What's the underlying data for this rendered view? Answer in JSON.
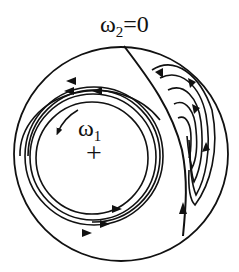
{
  "diagram": {
    "labels": {
      "top": "ω",
      "top_sub": "2",
      "top_suffix": "=0",
      "inner": "ω",
      "inner_sub": "1",
      "center_mark": "+"
    },
    "colors": {
      "stroke": "#111111",
      "background": "#ffffff"
    },
    "elements": {
      "outer_circle": "boundary",
      "inner_spiral": "concentric flow lines around ω1 vortex, flowing counter-clockwise",
      "separatrix": "line ω2=0 from top of circle down right side",
      "right_vortex": "nested loops between separatrix and boundary"
    }
  }
}
